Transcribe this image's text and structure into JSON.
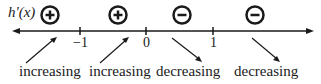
{
  "function_label": "h'(x)",
  "ticks": [
    {
      "label": "−1",
      "x": 80
    },
    {
      "label": "0",
      "x": 146
    },
    {
      "label": "1",
      "x": 213
    }
  ],
  "intervals": [
    {
      "sign": "+",
      "sign_icon": "plus-circle-icon",
      "behavior": "increasing",
      "arrow": "up-right"
    },
    {
      "sign": "+",
      "sign_icon": "plus-circle-icon",
      "behavior": "increasing",
      "arrow": "up-right"
    },
    {
      "sign": "−",
      "sign_icon": "minus-circle-icon",
      "behavior": "decreasing",
      "arrow": "down-right"
    },
    {
      "sign": "−",
      "sign_icon": "minus-circle-icon",
      "behavior": "decreasing",
      "arrow": "down-right"
    }
  ]
}
